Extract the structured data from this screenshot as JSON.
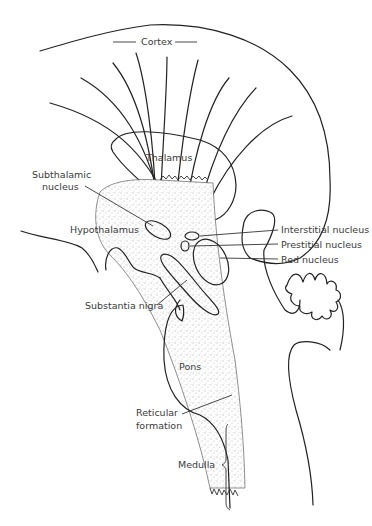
{
  "figure": {
    "type": "anatomical line drawing",
    "labels": {
      "cortex": "Cortex",
      "thalamus": "Thalamus",
      "subthalamic_1": "Subthalamic",
      "subthalamic_2": "nucleus",
      "hypothalamus": "Hypothalamus",
      "interstitial": "Interstitial nucleus",
      "prestitial": "Prestitial nucleus",
      "red": "Red nucleus",
      "substantia_nigra": "Substantia nigra",
      "pons": "Pons",
      "reticular_1": "Reticular",
      "reticular_2": "formation",
      "medulla": "Medulla"
    }
  }
}
